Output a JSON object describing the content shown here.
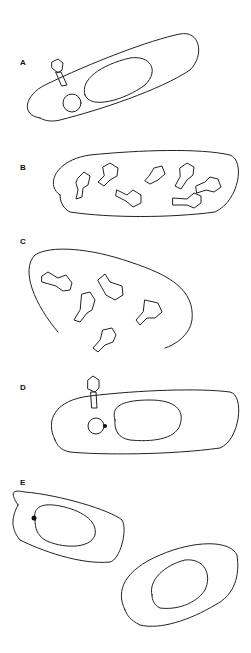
{
  "figure": {
    "panels": [
      {
        "label": "A",
        "description": "Phage attached to cell surface, injecting; cell with nucleus and circular DNA"
      },
      {
        "label": "B",
        "description": "Cell filled with assembled phage particles and heads"
      },
      {
        "label": "C",
        "description": "Lysed cell releasing phage particles"
      },
      {
        "label": "D",
        "description": "Phage attached; circular DNA with integration point"
      },
      {
        "label": "E",
        "description": "Prophage integrated into chromosome; dividing daughter cells"
      }
    ]
  }
}
